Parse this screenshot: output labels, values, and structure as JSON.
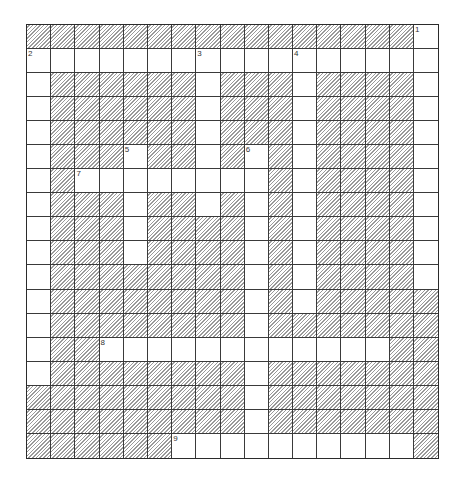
{
  "puzzle": {
    "rows": 18,
    "cols": 17,
    "colors": {
      "grid_line": "#3a3a3a",
      "hatch": "#9a9a9a",
      "background": "#ffffff"
    },
    "grid": [
      "11111111111111110",
      "00000000000000000",
      "01111110111011110",
      "01111110111011110",
      "01111110111011110",
      "01110110101011110",
      "01000000001011110",
      "01110110101011110",
      "01110111101011110",
      "01110111101011110",
      "01111111101011110",
      "01111111101011111",
      "01111111101111111",
      "01100000000000011",
      "01111111101111111",
      "11111111101111111",
      "11111111101111111",
      "11111100000000001"
    ],
    "clue_numbers": [
      {
        "number": "1",
        "row": 0,
        "col": 16
      },
      {
        "number": "2",
        "row": 1,
        "col": 0
      },
      {
        "number": "3",
        "row": 1,
        "col": 7
      },
      {
        "number": "4",
        "row": 1,
        "col": 11
      },
      {
        "number": "5",
        "row": 5,
        "col": 4
      },
      {
        "number": "6",
        "row": 5,
        "col": 9
      },
      {
        "number": "7",
        "row": 6,
        "col": 2
      },
      {
        "number": "8",
        "row": 13,
        "col": 3
      },
      {
        "number": "9",
        "row": 17,
        "col": 6
      }
    ]
  }
}
